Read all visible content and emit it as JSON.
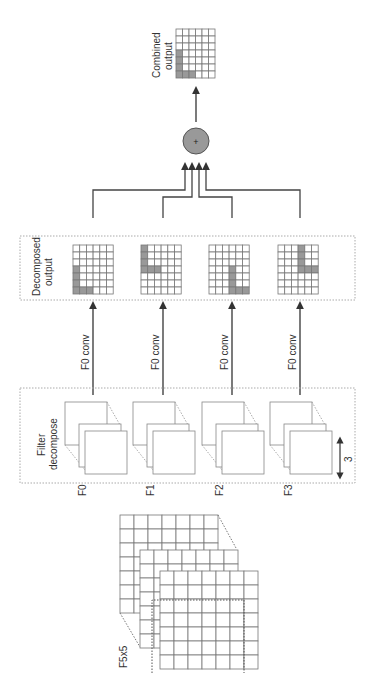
{
  "labels": {
    "combined_output": [
      "Combined",
      "output"
    ],
    "decomposed_output": [
      "Decomposed",
      "output"
    ],
    "filter_decompose": [
      "Filter",
      "decompose"
    ],
    "conv": [
      "F0 conv",
      "F0 conv",
      "F0 conv",
      "F0 conv"
    ],
    "filters": [
      "F0",
      "F1",
      "F2",
      "F3"
    ],
    "input_filter": "F5x5",
    "depth": "3",
    "sum_symbol": "+"
  },
  "colors": {
    "line": "#444444",
    "grid": "#777777",
    "shade": "#999999",
    "circle": "#999999",
    "dotted": "#aaaaaa"
  }
}
